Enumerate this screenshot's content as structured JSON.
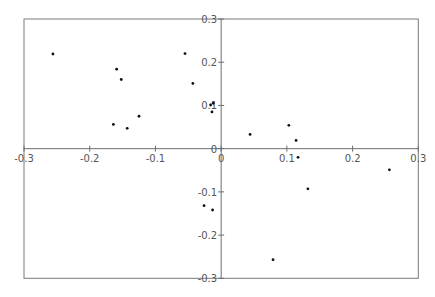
{
  "chart_data": {
    "type": "scatter",
    "title": "",
    "xlabel": "",
    "ylabel": "",
    "xlim": [
      -0.3,
      0.3
    ],
    "ylim": [
      -0.3,
      0.3
    ],
    "grid": false,
    "legend": null,
    "axes_style": "centered-crosshair-with-frame",
    "x_ticks": [
      -0.3,
      -0.2,
      -0.1,
      0,
      0.1,
      0.2,
      0.3
    ],
    "y_ticks": [
      -0.3,
      -0.2,
      -0.1,
      0,
      0.1,
      0.2,
      0.3
    ],
    "x_tick_labels": [
      "-0.3",
      "-0.2",
      "-0.1",
      "0",
      "0.1",
      "0.2",
      "0.3"
    ],
    "y_tick_labels": [
      "-0.3",
      "-0.2",
      "-0.1",
      "0",
      "0.1",
      "0.2",
      "0.3"
    ],
    "series": [
      {
        "name": "points",
        "color": "#111111",
        "marker": "dot",
        "points": [
          {
            "x": -0.256,
            "y": 0.219
          },
          {
            "x": -0.159,
            "y": 0.184
          },
          {
            "x": -0.152,
            "y": 0.16
          },
          {
            "x": -0.125,
            "y": 0.075
          },
          {
            "x": -0.164,
            "y": 0.056
          },
          {
            "x": -0.143,
            "y": 0.047
          },
          {
            "x": -0.055,
            "y": 0.22
          },
          {
            "x": -0.043,
            "y": 0.151
          },
          {
            "x": -0.016,
            "y": 0.101
          },
          {
            "x": -0.012,
            "y": 0.105
          },
          {
            "x": -0.014,
            "y": 0.085
          },
          {
            "x": 0.044,
            "y": 0.033
          },
          {
            "x": 0.103,
            "y": 0.054
          },
          {
            "x": 0.114,
            "y": 0.019
          },
          {
            "x": 0.117,
            "y": -0.02
          },
          {
            "x": 0.256,
            "y": -0.049
          },
          {
            "x": 0.132,
            "y": -0.093
          },
          {
            "x": -0.026,
            "y": -0.132
          },
          {
            "x": -0.013,
            "y": -0.142
          },
          {
            "x": 0.079,
            "y": -0.257
          }
        ]
      }
    ]
  },
  "style": {
    "frame_color": "#7a7a7a",
    "axis_color": "#6e6e6e",
    "label_color": "#555555",
    "background": "#ffffff"
  }
}
